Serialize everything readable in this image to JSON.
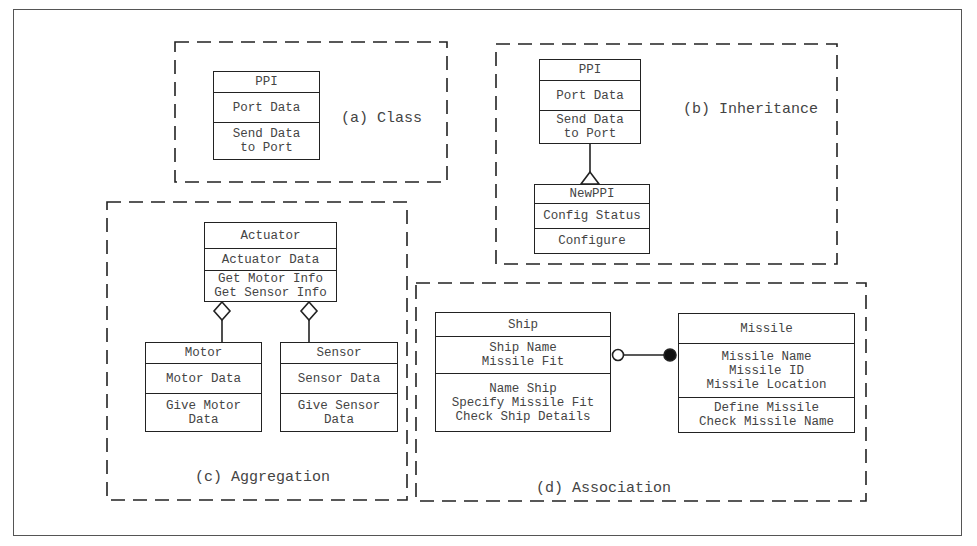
{
  "panels": {
    "class": {
      "caption": "(a) Class",
      "ppi": {
        "name": "PPI",
        "attributes": [
          "Port Data"
        ],
        "operations": [
          "Send Data",
          "to Port"
        ]
      }
    },
    "inheritance": {
      "caption": "(b) Inheritance",
      "parent": {
        "name": "PPI",
        "attributes": [
          "Port Data"
        ],
        "operations": [
          "Send Data",
          "to Port"
        ]
      },
      "child": {
        "name": "NewPPI",
        "attributes": [
          "Config Status"
        ],
        "operations": [
          "Configure"
        ]
      },
      "relation": "generalization (open triangle arrowhead at child top)"
    },
    "aggregation": {
      "caption": "(c) Aggregation",
      "whole": {
        "name": "Actuator",
        "attributes": [
          "Actuator Data"
        ],
        "operations": [
          "Get Motor Info",
          "Get Sensor Info"
        ]
      },
      "parts": [
        {
          "name": "Motor",
          "attributes": [
            "Motor Data"
          ],
          "operations": [
            "Give Motor",
            "Data"
          ]
        },
        {
          "name": "Sensor",
          "attributes": [
            "Sensor Data"
          ],
          "operations": [
            "Give Sensor",
            "Data"
          ]
        }
      ],
      "relation": "aggregation (hollow diamonds at whole)"
    },
    "association": {
      "caption": "(d) Association",
      "left": {
        "name": "Ship",
        "attributes": [
          "Ship Name",
          "Missile Fit"
        ],
        "operations": [
          "Name Ship",
          "Specify Missile Fit",
          "Check Ship Details"
        ]
      },
      "right": {
        "name": "Missile",
        "attributes": [
          "Missile Name",
          "Missile ID",
          "Missile Location"
        ],
        "operations": [
          "Define Missile",
          "Check Missile Name"
        ]
      },
      "relation": "association (open circle at Ship end, filled circle at Missile end)"
    }
  },
  "colors": {
    "line": "#222222",
    "text": "#444444",
    "background": "#ffffff"
  }
}
